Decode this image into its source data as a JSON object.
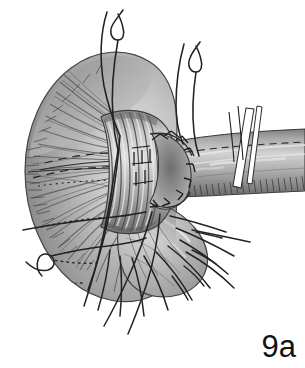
{
  "figure": {
    "caption_label": "9a",
    "title": "Surgical anastomosis illustration, figure 9a",
    "background_color": "#ffffff",
    "ink_color": "#1d1d1d",
    "tissue_mid_tone": "#9a9a9a",
    "tissue_dark_tone": "#5e5e5e",
    "tissue_light_tone": "#d4d4d4",
    "tape_color": "#ffffff",
    "canvas": {
      "width": 305,
      "height": 368
    }
  },
  "structures": {
    "flared_funnel": {
      "name": "flared funnel-shaped tissue with radiating fibers",
      "fiber_count": 34,
      "tone": "#9a9a9a",
      "notes": "bell / trumpet mouth opening to the left, radiating striated muscle fibers"
    },
    "collar_cuff": {
      "name": "banded collar cuff at neck of funnel",
      "band_count": 6,
      "tone": "#8d8d8d"
    },
    "anastomosis": {
      "name": "end-to-side anastomosis ring",
      "suture_stitch_count": 9,
      "stitch_type": "interrupted"
    },
    "tubular_conduit": {
      "name": "tubular conduit extending to right margin",
      "tone": "#9e9e9e",
      "hatched_lower_border": true
    },
    "lower_pouch": {
      "name": "rounded pouch below collar",
      "tone": "#b0b0b0"
    },
    "tape_slings": {
      "name": "white tape slings around conduit",
      "count": 2,
      "color": "#ffffff"
    },
    "hidden_contours": {
      "name": "dashed and dotted hidden edge contours",
      "dashed_line_count": 4,
      "dotted_line_count": 2
    }
  },
  "sutures": {
    "hooked_pairs_top": {
      "name": "hooked suture pairs above funnel",
      "count": 2,
      "strands": 4
    },
    "fanned_threads_bottom": {
      "name": "fanned suture threads below structure",
      "count": 9
    },
    "left_exit_thread": {
      "name": "suture thread exiting to the left",
      "count": 2
    },
    "thread_color": "#232323",
    "thread_width_px": 1.5
  }
}
